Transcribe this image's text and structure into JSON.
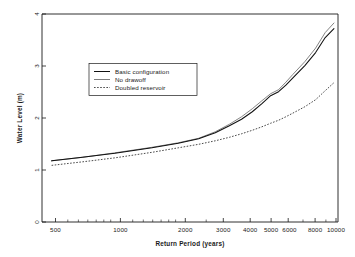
{
  "chart_data": {
    "type": "line",
    "title": "",
    "xlabel": "Return Period (years)",
    "ylabel": "Water Level (m)",
    "xscale": "log",
    "yscale": "linear",
    "xlim": [
      450,
      11500
    ],
    "ylim": [
      0,
      4.15
    ],
    "grid": false,
    "legend_position": "upper-left-inside",
    "xticks": [
      500,
      1000,
      2000,
      3000,
      4000,
      5000,
      6000,
      8000,
      10000
    ],
    "xticklabels": [
      "500",
      "1000",
      "2000",
      "3000",
      "4000",
      "5000",
      "6000",
      "8000",
      "10000"
    ],
    "yticks": [
      0,
      1,
      2,
      3,
      4
    ],
    "yticklabels": [
      "0",
      "1",
      "2",
      "3",
      "4"
    ],
    "x": [
      500,
      700,
      1000,
      1500,
      2000,
      2500,
      3000,
      3500,
      4000,
      4500,
      5000,
      5500,
      6000,
      6500,
      7000,
      8000,
      9000,
      10000,
      11000
    ],
    "series": [
      {
        "name": "Basic configuration",
        "style": "solid",
        "color": "#111111",
        "values": [
          1.22,
          1.29,
          1.37,
          1.48,
          1.57,
          1.66,
          1.78,
          1.92,
          2.05,
          2.2,
          2.36,
          2.52,
          2.6,
          2.73,
          2.87,
          3.12,
          3.38,
          3.68,
          3.86
        ]
      },
      {
        "name": "No drawoff",
        "style": "solid-thin",
        "color": "#6e6e6e",
        "values": [
          1.22,
          1.29,
          1.38,
          1.49,
          1.58,
          1.67,
          1.8,
          1.95,
          2.1,
          2.26,
          2.42,
          2.56,
          2.64,
          2.79,
          2.94,
          3.2,
          3.47,
          3.78,
          3.97
        ]
      },
      {
        "name": "Doubled reservoir",
        "style": "dashed",
        "color": "#2b2b2b",
        "values": [
          1.13,
          1.2,
          1.28,
          1.39,
          1.48,
          1.55,
          1.62,
          1.69,
          1.76,
          1.83,
          1.9,
          1.97,
          2.03,
          2.1,
          2.17,
          2.3,
          2.44,
          2.62,
          2.78
        ]
      }
    ]
  },
  "legend": {
    "items": [
      {
        "label": "Basic configuration"
      },
      {
        "label": "No drawoff"
      },
      {
        "label": "Doubled reservoir"
      }
    ]
  }
}
